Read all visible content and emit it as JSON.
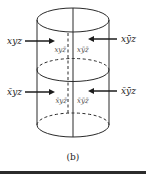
{
  "figure": {
    "caption": "(b)",
    "labels": {
      "top_left_outer": "xyz",
      "top_right_outer": "xȳz",
      "top_inner_left": "xyz̄",
      "top_inner_right": "xȳz̄",
      "bottom_left_outer": "x̄yz",
      "bottom_right_outer": "x̄ȳz",
      "bottom_inner_left": "x̄yz̄",
      "bottom_inner_right": "x̄ȳz̄"
    },
    "colors": {
      "line": "#2a2a2a",
      "inner_label": "#4a4a4a",
      "rule": "#2b2b2b",
      "background": "#ffffff"
    }
  }
}
